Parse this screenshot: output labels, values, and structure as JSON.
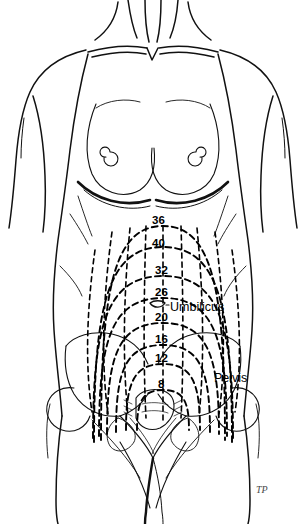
{
  "figure": {
    "line_color": "#000000",
    "background_color": "#ffffff",
    "signature": "TP"
  },
  "annotations": [
    {
      "name": "umbilicus",
      "label": "Umbilicus",
      "x": 170,
      "y": 300
    },
    {
      "name": "pelvis",
      "label": "Pelvis",
      "x": 214,
      "y": 371
    }
  ],
  "chart_data": {
    "type": "line",
    "xlabel": "",
    "ylabel": "Weeks of gestation",
    "grid": false,
    "legend": "none",
    "units": "weeks",
    "categories": [
      "8",
      "12",
      "16",
      "20",
      "26",
      "32",
      "36",
      "40"
    ],
    "values": [
      8,
      12,
      16,
      20,
      26,
      32,
      36,
      40
    ],
    "note": "Each dashed arc marks the level of the uterine fundus; 36 weeks is the highest, the fundus drops (lightening) by 40 weeks.",
    "markers": [
      {
        "weeks": 8,
        "label": "8",
        "label_x": 158,
        "label_y": 378,
        "apex_y": 390,
        "half_width": 26,
        "center_x": 163,
        "base_y": 430
      },
      {
        "weeks": 12,
        "label": "12",
        "label_x": 155,
        "label_y": 352,
        "apex_y": 364,
        "half_width": 37,
        "center_x": 163,
        "base_y": 430
      },
      {
        "weeks": 16,
        "label": "16",
        "label_x": 155,
        "label_y": 333,
        "apex_y": 345,
        "half_width": 47,
        "center_x": 163,
        "base_y": 432
      },
      {
        "weeks": 20,
        "label": "20",
        "label_x": 155,
        "label_y": 311,
        "apex_y": 323,
        "half_width": 56,
        "center_x": 163,
        "base_y": 434
      },
      {
        "weeks": 26,
        "label": "26",
        "label_x": 155,
        "label_y": 286,
        "apex_y": 298,
        "half_width": 64,
        "center_x": 163,
        "base_y": 436
      },
      {
        "weeks": 32,
        "label": "32",
        "label_x": 155,
        "label_y": 264,
        "apex_y": 276,
        "half_width": 70,
        "center_x": 163,
        "base_y": 438
      },
      {
        "weeks": 36,
        "label": "36",
        "label_x": 152,
        "label_y": 214,
        "apex_y": 226,
        "half_width": 62,
        "center_x": 163,
        "base_y": 440
      },
      {
        "weeks": 40,
        "label": "40",
        "label_x": 152,
        "label_y": 237,
        "apex_y": 247,
        "half_width": 69,
        "center_x": 163,
        "base_y": 442
      }
    ]
  }
}
